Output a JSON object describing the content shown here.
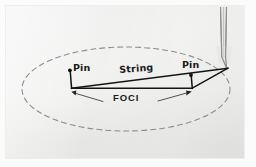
{
  "figure": {
    "background_color": "#ffffff",
    "page_color": "#ececeb"
  },
  "labels": {
    "pin_left": "Pin",
    "pin_right": "Pin",
    "string": "String",
    "foci": "FOCI"
  },
  "colors": {
    "ink": "#1b1b1b",
    "ellipse_dash": "#8d8d8b",
    "pencil": "#9a9a98",
    "leader": "#3a3a3a"
  },
  "geometry": {
    "ellipse": {
      "cx": 126,
      "cy": 89,
      "rx": 104,
      "ry": 42,
      "stroke": "dashed"
    },
    "pin_left": {
      "x": 69,
      "y": 70
    },
    "pin_right": {
      "x": 191,
      "y": 75
    },
    "pencil_point": {
      "x": 228,
      "y": 68
    },
    "baseline_left": {
      "x": 71,
      "y": 88
    },
    "baseline_right": {
      "x": 192,
      "y": 88
    }
  }
}
